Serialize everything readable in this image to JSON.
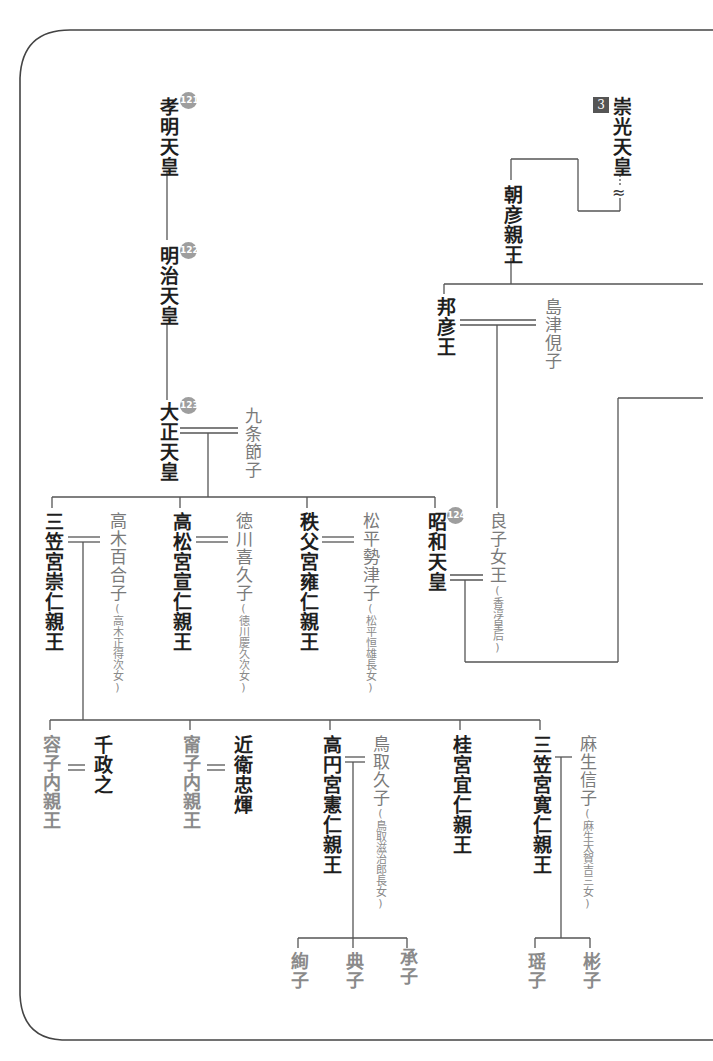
{
  "diagram": {
    "frame": {
      "border_color": "#555555",
      "line_color": "#444444"
    },
    "reign_badges": {
      "komei": "121",
      "meiji": "122",
      "taisho": "123",
      "showa": "124"
    },
    "northern_badge": "3",
    "people": {
      "komei": "孝明天皇",
      "meiji": "明治天皇",
      "taisho": "大正天皇",
      "taisho_spouse": "九条節子",
      "suko": "崇光天皇",
      "suko_suffix": "…",
      "wave": "≈",
      "asahiko": "朝彦親王",
      "kuniyoshi": "邦彦王",
      "kuniyoshi_spouse": "島津俔子",
      "mikasa_takahito": "三笠宮崇仁親王",
      "mikasa_takahito_spouse": "高木百合子",
      "mikasa_takahito_spouse_note": "(高木正得次女)",
      "takamatsu": "高松宮宣仁親王",
      "takamatsu_spouse": "徳川喜久子",
      "takamatsu_spouse_note": "(徳川慶久次女)",
      "chichibu": "秩父宮雍仁親王",
      "chichibu_spouse": "松平勢津子",
      "chichibu_spouse_note": "(松平恒雄長女)",
      "showa": "昭和天皇",
      "showa_spouse": "良子女王",
      "showa_spouse_note": "(香淳皇后)",
      "yasuko": "容子内親王",
      "yasuko_spouse": "千政之",
      "masako": "甯子内親王",
      "masako_spouse": "近衛忠煇",
      "takamado": "高円宮憲仁親王",
      "takamado_spouse": "鳥取久子",
      "takamado_spouse_note": "(鳥取滋治郎長女)",
      "katsura": "桂宮宜仁親王",
      "tomohito": "三笠宮寛仁親王",
      "tomohito_spouse": "麻生信子",
      "tomohito_spouse_note": "(麻生太賀吉三女)",
      "tsuguko": "絢子",
      "noriko": "典子",
      "tsuguko2": "承子",
      "yoko": "瑶子",
      "akiko": "彬子"
    }
  }
}
